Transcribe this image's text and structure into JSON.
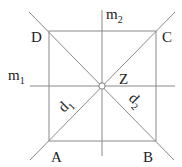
{
  "diagram": {
    "colors": {
      "line": "#8a8a8a",
      "text": "#222222",
      "center_fill": "#ffffff"
    },
    "vertices": {
      "A": {
        "label": "A",
        "x": 49,
        "y": 141
      },
      "B": {
        "label": "B",
        "x": 156,
        "y": 141
      },
      "C": {
        "label": "C",
        "x": 156,
        "y": 31
      },
      "D": {
        "label": "D",
        "x": 49,
        "y": 31
      }
    },
    "center": {
      "label": "Z",
      "x": 102,
      "y": 86,
      "r": 3
    },
    "axes": {
      "m1": {
        "label": "m",
        "subscript": "1",
        "orientation": "horizontal"
      },
      "m2": {
        "label": "m",
        "subscript": "2",
        "orientation": "vertical"
      },
      "d1": {
        "label": "d",
        "subscript": "1",
        "orientation": "diagonal A-C"
      },
      "d2": {
        "label": "d",
        "subscript": "2",
        "orientation": "diagonal D-B"
      }
    }
  }
}
